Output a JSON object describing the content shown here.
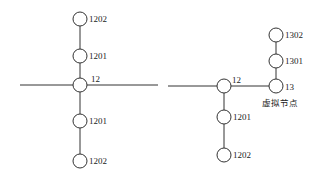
{
  "diagram": {
    "left": {
      "nodes": [
        {
          "id": "n1202_top",
          "label": "1202",
          "x": 80,
          "y": 19
        },
        {
          "id": "n1201_top",
          "label": "1201",
          "x": 80,
          "y": 56
        },
        {
          "id": "n12",
          "label": "12",
          "x": 80,
          "y": 85
        },
        {
          "id": "n1201_bot",
          "label": "1201",
          "x": 80,
          "y": 121
        },
        {
          "id": "n1202_bot",
          "label": "1202",
          "x": 80,
          "y": 161
        }
      ]
    },
    "right": {
      "nodes": [
        {
          "id": "r12",
          "label": "12",
          "x": 224,
          "y": 86
        },
        {
          "id": "r13",
          "label": "13",
          "x": 276,
          "y": 86
        },
        {
          "id": "r1301",
          "label": "1301",
          "x": 276,
          "y": 61
        },
        {
          "id": "r1302",
          "label": "1302",
          "x": 276,
          "y": 35
        },
        {
          "id": "r1201",
          "label": "1201",
          "x": 224,
          "y": 117
        },
        {
          "id": "r1202",
          "label": "1202",
          "x": 224,
          "y": 155
        }
      ],
      "virtual_node_label": "虚拟节点"
    }
  }
}
